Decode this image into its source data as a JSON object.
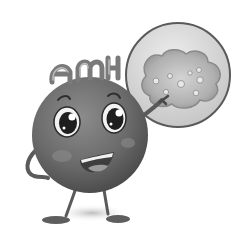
{
  "illustration": {
    "subject": "cartoon ball character pointing at magnified follicle cell",
    "head_text": "AMH",
    "letters": [
      "A",
      "M",
      "H"
    ],
    "colors": {
      "background": "#ffffff",
      "body": "#6e6e6e",
      "body_dark": "#4a4a4a",
      "lens_fill": "#d9d9d9",
      "lens_rim": "#5a5a5a",
      "cell": "#a8a8a8",
      "cell_inner": "#c8c8c8",
      "mouth": "#8a8a8a",
      "tongue": "#9a9a9a",
      "eye_white": "#f2f2f2",
      "pupil": "#1e1e1e"
    }
  }
}
